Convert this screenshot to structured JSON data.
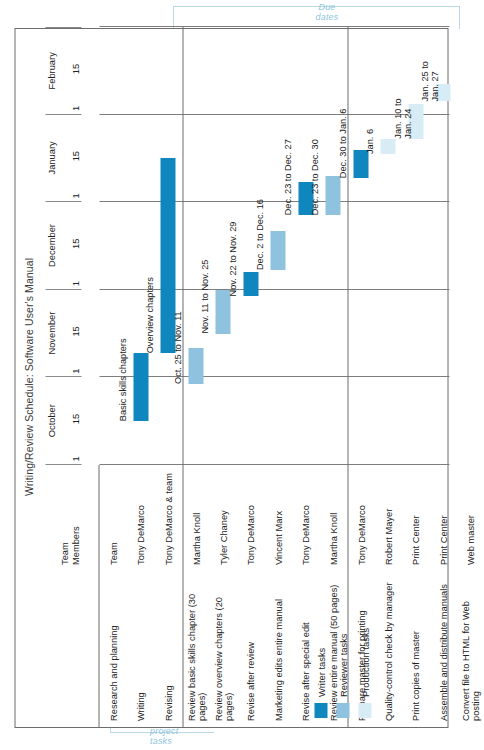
{
  "title": "Writing/Review Schedule: Software User's Manual",
  "annotations": {
    "top": "Due\ndates",
    "bottom": "Class\nproject\ntasks"
  },
  "legend": {
    "items": [
      {
        "label": "Writer tasks",
        "color": "#0f86bd"
      },
      {
        "label": "Reviewer tasks",
        "color": "#8fc2de"
      },
      {
        "label": "Production tasks",
        "color": "#d8ecf6"
      }
    ]
  },
  "columns": {
    "task_header": "",
    "member_header": "Team\nMembers"
  },
  "chart_data": {
    "type": "bar",
    "title": "Writing/Review Schedule: Software User's Manual",
    "xlabel": "",
    "ylabel": "",
    "axis": {
      "months": [
        "October",
        "November",
        "December",
        "January",
        "February"
      ],
      "ticks": [
        "1",
        "15"
      ],
      "start": "Oct 1",
      "end": "Feb 15",
      "grid": true
    },
    "legend_position": "bottom-left",
    "groups": [
      {
        "name": "Writing group",
        "rows": [
          {
            "task": "Research and planning",
            "member": "Team",
            "bars": [],
            "label": ""
          },
          {
            "task": "Writing",
            "member": "Tony DeMarco",
            "bars": [
              {
                "start_pct": 10.0,
                "end_pct": 25.5,
                "type": "writer"
              }
            ],
            "label": "Basic skills chapters"
          },
          {
            "task": "Revising",
            "member": "Tony DeMarco & team",
            "bars": [
              {
                "start_pct": 25.5,
                "end_pct": 70.0,
                "type": "writer"
              }
            ],
            "label": "Overview chapters"
          }
        ]
      },
      {
        "name": "Review group",
        "rows": [
          {
            "task": "Review basic skills chapter (30 pages)",
            "member": "Martha Knoll",
            "bars": [
              {
                "start_pct": 18.5,
                "end_pct": 26.8,
                "type": "reviewer"
              }
            ],
            "label": "Oct. 25 to Nov. 11"
          },
          {
            "task": "Review overview chapters (20 pages)",
            "member": "Tyler Chaney",
            "bars": [
              {
                "start_pct": 30.0,
                "end_pct": 40.0,
                "type": "reviewer"
              }
            ],
            "label": "Nov. 11 to Nov. 25"
          },
          {
            "task": "Revise after review",
            "member": "Tony DeMarco",
            "bars": [
              {
                "start_pct": 38.5,
                "end_pct": 44.0,
                "type": "writer"
              }
            ],
            "label": "Nov. 22 to Nov. 29"
          },
          {
            "task": "Marketing edits entire manual",
            "member": "Vincent Marx",
            "bars": [
              {
                "start_pct": 44.5,
                "end_pct": 53.5,
                "type": "reviewer"
              }
            ],
            "label": "Dec. 2 to Dec. 16"
          },
          {
            "task": "Revise after special edit",
            "member": "Tony DeMarco",
            "bars": [
              {
                "start_pct": 57.0,
                "end_pct": 64.5,
                "type": "writer"
              }
            ],
            "label": "Dec. 23 to Dec. 27"
          },
          {
            "task": "Review entire manual (50 pages)",
            "member": "Martha Knoll",
            "bars": [
              {
                "start_pct": 57.0,
                "end_pct": 66.0,
                "type": "reviewer"
              }
            ],
            "label": "Dec. 23 to Dec. 30"
          }
        ]
      },
      {
        "name": "Production group",
        "rows": [
          {
            "task": "Prepare master for printing",
            "member": "Tony DeMarco",
            "bars": [
              {
                "start_pct": 65.5,
                "end_pct": 72.0,
                "type": "writer"
              }
            ],
            "label": "Dec. 30 to Jan. 6"
          },
          {
            "task": "Quality-control check by manager",
            "member": "Robert Mayer",
            "bars": [
              {
                "start_pct": 71.0,
                "end_pct": 74.5,
                "type": "production"
              }
            ],
            "label": "Jan. 6"
          },
          {
            "task": "Print copies of master",
            "member": "Print Center",
            "bars": [
              {
                "start_pct": 74.5,
                "end_pct": 82.5,
                "type": "production"
              }
            ],
            "label": "Jan. 10 to\nJan. 24"
          },
          {
            "task": "Assemble and distribute manuals",
            "member": "Print Center",
            "bars": [
              {
                "start_pct": 83.0,
                "end_pct": 87.0,
                "type": "production"
              }
            ],
            "label": "Jan. 25 to\nJan. 27"
          },
          {
            "task": "Convert file to HTML for Web posting",
            "member": "Web master",
            "bars": [],
            "label": ""
          }
        ]
      }
    ]
  }
}
